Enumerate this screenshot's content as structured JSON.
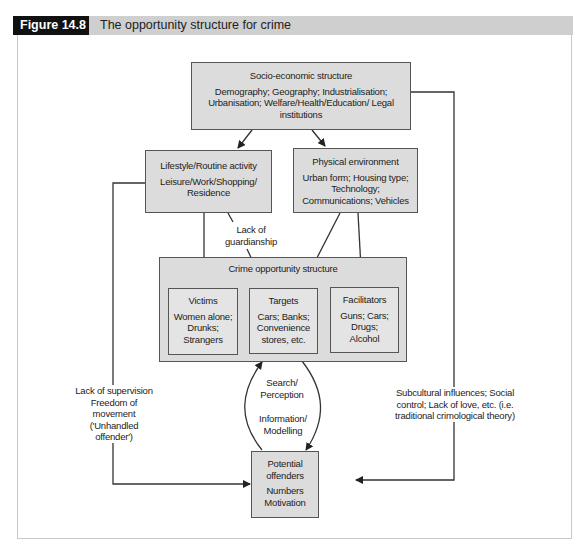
{
  "figure": {
    "label": "Figure 14.8",
    "title": "The opportunity structure for crime"
  },
  "colors": {
    "label_bg": "#111111",
    "header_bg": "#cfcfcf",
    "box_fill": "#dcdcdc",
    "line": "#333333"
  },
  "nodes": {
    "socio": {
      "title": "Socio-economic structure",
      "body": "Demography; Geography; Industrialisation; Urbanisation; Welfare/Health/Education/ Legal institutions"
    },
    "lifestyle": {
      "title": "Lifestyle/Routine activity",
      "body": "Leisure/Work/Shopping/ Residence"
    },
    "physical": {
      "title": "Physical environment",
      "body": "Urban form; Housing type; Technology; Communications; Vehicles"
    },
    "crime_structure": {
      "title": "Crime opportunity structure"
    },
    "victims": {
      "title": "Victims",
      "body": "Women alone; Drunks; Strangers"
    },
    "targets": {
      "title": "Targets",
      "body": "Cars; Banks; Convenience stores, etc."
    },
    "facilitators": {
      "title": "Facilitators",
      "body": "Guns; Cars; Drugs; Alcohol"
    },
    "offenders": {
      "title": "Potential offenders",
      "body": "Numbers Motivation"
    }
  },
  "edge_labels": {
    "guardianship": "Lack of guardianship",
    "search": "Search/ Perception",
    "information": "Information/ Modelling",
    "supervision": "Lack of supervision Freedom of movement ('Unhandled offender')",
    "subcultural": "Subcultural influences; Social control; Lack of love, etc. (i.e. traditional crimological theory)"
  }
}
